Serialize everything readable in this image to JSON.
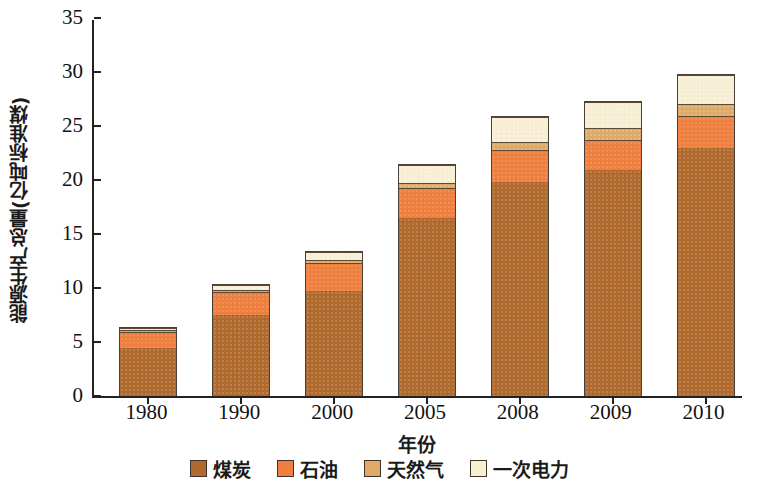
{
  "chart_data": {
    "type": "bar",
    "subtype": "stacked-bar",
    "title": "",
    "xlabel": "年份",
    "ylabel": "能源生产总量(亿吨标准煤)",
    "categories": [
      "1980",
      "1990",
      "2000",
      "2005",
      "2008",
      "2009",
      "2010"
    ],
    "ylim": [
      0,
      35
    ],
    "ytick_step": 5,
    "yticks": [
      "0",
      "5",
      "10",
      "15",
      "20",
      "25",
      "30",
      "35"
    ],
    "grid": false,
    "legend_position": "bottom",
    "series": [
      {
        "name": "煤炭",
        "color": "#b06a2e",
        "values": [
          4.5,
          7.6,
          9.8,
          16.6,
          19.9,
          21.0,
          23.0
        ]
      },
      {
        "name": "石油",
        "color": "#ee7f3e",
        "values": [
          1.5,
          2.1,
          2.6,
          2.7,
          3.0,
          2.8,
          3.0
        ]
      },
      {
        "name": "天然气",
        "color": "#dfa967",
        "values": [
          0.2,
          0.2,
          0.3,
          0.5,
          0.7,
          1.1,
          1.1
        ]
      },
      {
        "name": "一次电力",
        "color": "#f7eed3",
        "values": [
          0.2,
          0.5,
          0.7,
          1.7,
          2.3,
          2.4,
          2.7
        ]
      }
    ],
    "totals": [
      6.4,
      10.4,
      13.4,
      21.5,
      25.9,
      27.3,
      29.8
    ]
  },
  "legend": {
    "items": [
      {
        "label": "煤炭",
        "color": "#b06a2e",
        "key": "coal"
      },
      {
        "label": "石油",
        "color": "#ee7f3e",
        "key": "oil"
      },
      {
        "label": "天然气",
        "color": "#dfa967",
        "key": "gas"
      },
      {
        "label": "一次电力",
        "color": "#f7eed3",
        "key": "power"
      }
    ]
  },
  "axes": {
    "y_title": "能源生产总量(亿吨标准煤)",
    "x_title": "年份"
  }
}
